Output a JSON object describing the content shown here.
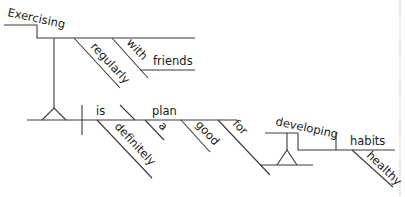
{
  "diagram": {
    "type": "sentence-diagram",
    "sentence": "Exercising regularly with friends is definitely a good plan for developing healthy habits",
    "subject_phrase": {
      "gerund": "Exercising",
      "modifiers": {
        "adverb": "regularly",
        "preposition": "with",
        "object": "friends"
      }
    },
    "verb": "is",
    "verb_modifier": "definitely",
    "complement": {
      "noun": "plan",
      "modifiers": [
        "a",
        "good"
      ]
    },
    "prepositional_phrase": {
      "preposition": "for",
      "gerund": "developing",
      "object": "habits",
      "object_modifier": "healthy"
    }
  },
  "colors": {
    "line": "#3a3a3a",
    "text": "#1a1a1a",
    "border": "#9a9a9a",
    "background": "#ffffff"
  }
}
